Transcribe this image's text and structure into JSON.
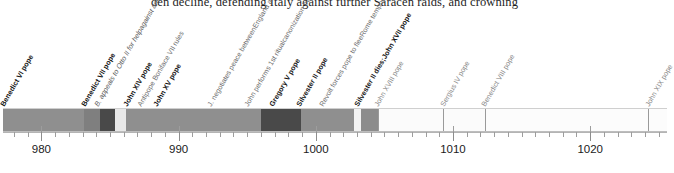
{
  "body_text": "den decline, defending Italy against further Saracen raids, and crowning",
  "chart_data": {
    "type": "timeline",
    "title": "",
    "xlabel": "",
    "ylabel": "",
    "xlim": [
      977.2,
      1025.6
    ],
    "grid": false,
    "legend": "none",
    "axis": {
      "major_ticks": [
        980,
        990,
        1000,
        1010,
        1020
      ],
      "major_tick_labels": [
        "980",
        "990",
        "1000",
        "1010",
        "1020"
      ],
      "minor_tick_interval": 1
    },
    "segments": [
      {
        "start": 977.2,
        "end": 983.1,
        "color": "#8f8f8f",
        "label": "Benedict VI / Benedict VII pope"
      },
      {
        "start": 983.1,
        "end": 984.3,
        "color": "#7f7f7f",
        "label": "Benedict VII reign"
      },
      {
        "start": 984.3,
        "end": 985.4,
        "color": "#494949",
        "label": "Antipope Boniface VII rules"
      },
      {
        "start": 985.4,
        "end": 986.2,
        "color": "#e8e8e8",
        "label": "John XIV pope"
      },
      {
        "start": 986.2,
        "end": 996.0,
        "color": "#8f8f8f",
        "label": "John XV pope"
      },
      {
        "start": 996.0,
        "end": 998.9,
        "color": "#494949",
        "label": "Gregory V pope"
      },
      {
        "start": 998.9,
        "end": 1002.8,
        "color": "#8f8f8f",
        "label": "Silvester II pope"
      },
      {
        "start": 1002.8,
        "end": 1003.3,
        "color": "#f2f2f2",
        "label": "transition"
      },
      {
        "start": 1003.3,
        "end": 1004.5,
        "color": "#8c8c8c",
        "label": "John XVII pope"
      },
      {
        "start": 1004.5,
        "end": 1009.3,
        "color": "#fbfbfb",
        "label": "John XVIII pope"
      },
      {
        "start": 1009.3,
        "end": 1012.3,
        "color": "#fbfbfb",
        "label": "Sergius IV pope"
      },
      {
        "start": 1012.3,
        "end": 1024.2,
        "color": "#fcfcfc",
        "label": "Benedict VIII pope"
      },
      {
        "start": 1024.2,
        "end": 1025.6,
        "color": "#fcfcfc",
        "label": "John XIX pope"
      }
    ],
    "dividers": [
      1004.5,
      1009.3,
      1012.3,
      1024.2
    ],
    "events": [
      {
        "year": 977.4,
        "label": "Benedict VI pope",
        "style": "bold"
      },
      {
        "year": 983.3,
        "label": "Benedict VII pope",
        "style": "bold"
      },
      {
        "year": 984.3,
        "label": "B. appeals to Otto II for help against antipope Boniface VII",
        "style": "note"
      },
      {
        "year": 986.4,
        "label": "John XIV pope",
        "style": "bold"
      },
      {
        "year": 987.4,
        "label": "Antipope Boniface VII rules",
        "style": "note2"
      },
      {
        "year": 988.6,
        "label": "John XV pope",
        "style": "bold"
      },
      {
        "year": 992.5,
        "label": "J. negotiates peace between England and Normandy",
        "style": "note2"
      },
      {
        "year": 995.2,
        "label": "John performs 1st ritual canonization by a pope",
        "style": "note2"
      },
      {
        "year": 997.0,
        "label": "Gregory V pope",
        "style": "bold"
      },
      {
        "year": 999.0,
        "label": "Silvester II pope",
        "style": "bold"
      },
      {
        "year": 1000.7,
        "label": "Revolt forces pope to flee Rome temporarily",
        "style": "note2"
      },
      {
        "year": 1003.2,
        "label": "Silvester II dies; John XVII pope",
        "style": "bold"
      },
      {
        "year": 1004.7,
        "label": "John XVIII pope",
        "style": "faint"
      },
      {
        "year": 1009.5,
        "label": "Sergius IV pope",
        "style": "faint"
      },
      {
        "year": 1012.5,
        "label": "Benedict VIII pope",
        "style": "faint"
      },
      {
        "year": 1024.4,
        "label": "John XIX pope",
        "style": "faint"
      }
    ]
  }
}
